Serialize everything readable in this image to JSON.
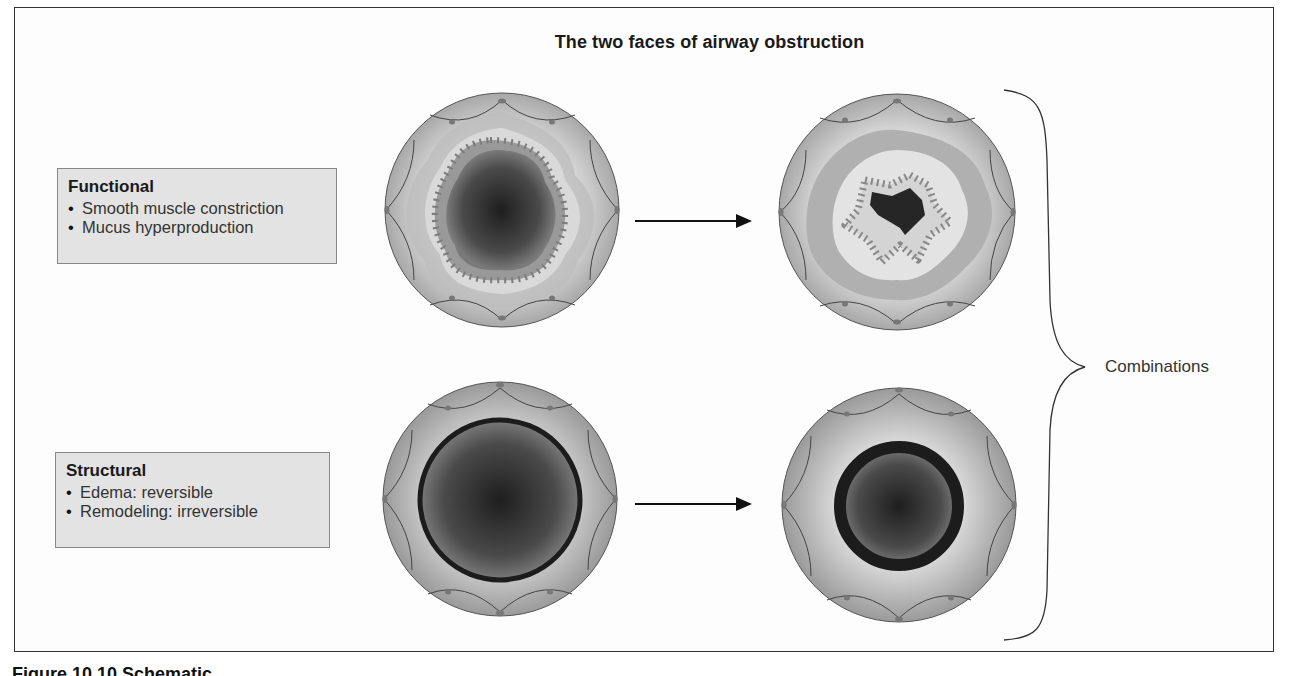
{
  "figure": {
    "title": "The two faces of airway obstruction",
    "caption_partial": "Figure 10.10 Schematic",
    "functional": {
      "heading": "Functional",
      "bullets": [
        "Smooth muscle constriction",
        "Mucus hyperproduction"
      ]
    },
    "structural": {
      "heading": "Structural",
      "bullets": [
        "Edema: reversible",
        "Remodeling: irreversible"
      ]
    },
    "bracket_label": "Combinations",
    "panels": [
      {
        "id": "functional-normal",
        "description": "Airway cross-section, open lumen with folded epithelium"
      },
      {
        "id": "functional-obstructed",
        "description": "Airway cross-section, constricted star-shaped lumen"
      },
      {
        "id": "structural-normal",
        "description": "Airway cross-section, round lumen with thin wall"
      },
      {
        "id": "structural-obstructed",
        "description": "Airway cross-section, narrowed lumen with thickened wall"
      }
    ],
    "colors": {
      "frame": "#333333",
      "label_box_bg": "#e3e3e3",
      "tissue_light": "#d8d8d8",
      "tissue_mid": "#aaaaaa",
      "lumen_dark": "#2a2a2a"
    }
  }
}
